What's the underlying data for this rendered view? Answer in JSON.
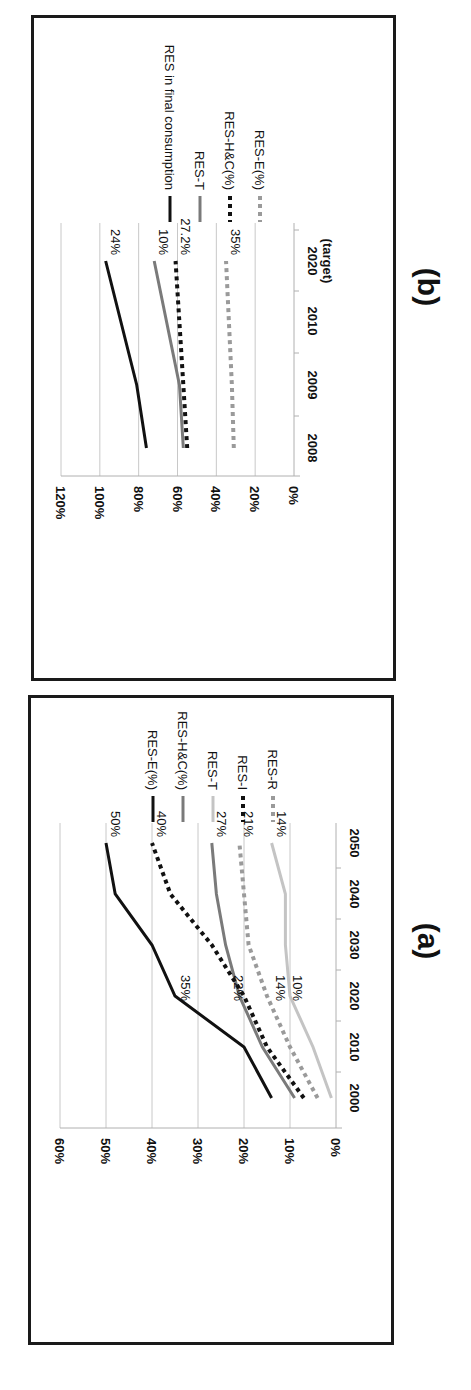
{
  "chart_data": [
    {
      "id": "b",
      "panel_label": "(b)",
      "type": "line",
      "orientation": "rotated 90deg clockwise",
      "title": "",
      "xlabel": "",
      "ylabel": "",
      "categories": [
        "2008",
        "2009",
        "2010",
        "2020 (target)"
      ],
      "category_lines": [
        "2008",
        "2009",
        "2010",
        "2020|(target)"
      ],
      "ylim": [
        0,
        120
      ],
      "yticks": [
        "0%",
        "20%",
        "40%",
        "60%",
        "80%",
        "100%",
        "120%"
      ],
      "grid": true,
      "legend_position": "right",
      "series": [
        {
          "name": "RES in final consumption",
          "style": "solid",
          "color": "#111111",
          "width": 3,
          "x_index": [
            0,
            1,
            3
          ],
          "values": [
            76,
            81,
            97
          ],
          "end_label": "24%"
        },
        {
          "name": "RES-T",
          "style": "solid",
          "color": "#7a7a7a",
          "width": 3,
          "x_index": [
            0,
            1,
            3
          ],
          "values": [
            57,
            59,
            72
          ],
          "end_label": "10%"
        },
        {
          "name": "RES-H&C(%)",
          "style": "dotted",
          "color": "#111111",
          "width": 4,
          "x_index": [
            0,
            1,
            3
          ],
          "values": [
            55,
            57,
            61
          ],
          "end_label": "27.2%"
        },
        {
          "name": "RES-E(%)",
          "style": "dotted",
          "color": "#9a9a9a",
          "width": 4,
          "x_index": [
            0,
            1,
            3
          ],
          "values": [
            31,
            32,
            35
          ],
          "end_label": "35%"
        }
      ]
    },
    {
      "id": "a",
      "panel_label": "(a)",
      "type": "line",
      "orientation": "rotated 90deg clockwise",
      "title": "",
      "xlabel": "",
      "ylabel": "",
      "categories": [
        "2000",
        "2010",
        "2020",
        "2030",
        "2040",
        "2050"
      ],
      "ylim": [
        0,
        60
      ],
      "yticks": [
        "0%",
        "10%",
        "20%",
        "30%",
        "40%",
        "50%",
        "60%"
      ],
      "grid": true,
      "legend_position": "right",
      "series": [
        {
          "name": "RES-E(%)",
          "style": "solid",
          "color": "#111111",
          "width": 3,
          "values": [
            14,
            20,
            35,
            40,
            48,
            50
          ],
          "end_label": "50%",
          "mid_label": "35%"
        },
        {
          "name": "RES-H&C(%)",
          "style": "solid",
          "color": "#7a7a7a",
          "width": 3,
          "values": [
            9,
            16,
            21,
            24,
            26,
            27
          ],
          "end_label": "27%",
          "mid_label": "22%"
        },
        {
          "name": "RES-T",
          "style": "solid",
          "color": "#c4c4c4",
          "width": 3,
          "values": [
            1,
            5,
            10,
            11,
            11,
            14
          ],
          "end_label": "14%",
          "mid_label": "10%"
        },
        {
          "name": "RES-I",
          "style": "dotted",
          "color": "#111111",
          "width": 4,
          "values": [
            7,
            15,
            20,
            27,
            36,
            40
          ],
          "end_label": "40%"
        },
        {
          "name": "RES-R",
          "style": "dotted",
          "color": "#9a9a9a",
          "width": 4,
          "values": [
            4,
            10,
            15,
            19,
            20,
            21
          ],
          "end_label": "21%",
          "mid_label": "14%"
        }
      ]
    }
  ]
}
